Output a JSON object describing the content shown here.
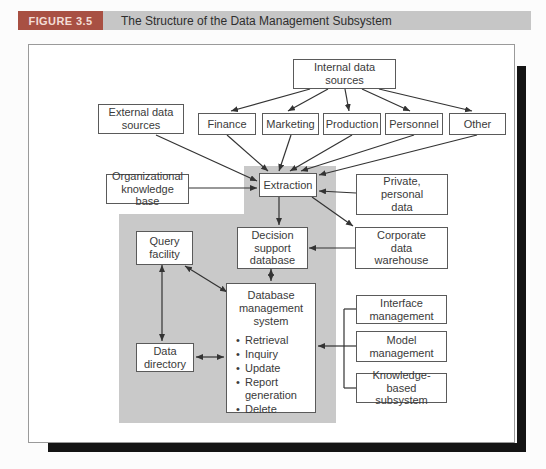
{
  "header": {
    "figure_label": "FIGURE 3.5",
    "title": "The Structure of the Data Management Subsystem"
  },
  "colors": {
    "figure_label_bg": "#a85043",
    "figure_label_text": "#f3ddd6",
    "header_bar_bg": "#c6c6c6",
    "panel_bg": "#ffffff",
    "panel_border": "#9a9a9a",
    "drop_shadow": "#141414",
    "shaded_region": "#c9c9c9",
    "box_border": "#5a5a5a",
    "arrow": "#333333",
    "text": "#3a3a3a"
  },
  "nodes": {
    "internal_data_sources": {
      "lines": [
        "Internal data",
        "sources"
      ]
    },
    "external_data_sources": {
      "lines": [
        "External data",
        "sources"
      ]
    },
    "finance": {
      "lines": [
        "Finance"
      ]
    },
    "marketing": {
      "lines": [
        "Marketing"
      ]
    },
    "production": {
      "lines": [
        "Production"
      ]
    },
    "personnel": {
      "lines": [
        "Personnel"
      ]
    },
    "other": {
      "lines": [
        "Other"
      ]
    },
    "organizational_knowledge_base": {
      "lines": [
        "Organizational",
        "knowledge base"
      ]
    },
    "extraction": {
      "lines": [
        "Extraction"
      ]
    },
    "private_personal_data": {
      "lines": [
        "Private,",
        "personal",
        "data"
      ]
    },
    "corporate_data_warehouse": {
      "lines": [
        "Corporate",
        "data",
        "warehouse"
      ]
    },
    "decision_support_database": {
      "lines": [
        "Decision",
        "support",
        "database"
      ]
    },
    "query_facility": {
      "lines": [
        "Query",
        "facility"
      ]
    },
    "database_management_system": {
      "lines": [
        "Database",
        "management",
        "system"
      ],
      "functions": [
        "Retrieval",
        "Inquiry",
        "Update",
        "Report generation",
        "Delete"
      ]
    },
    "data_directory": {
      "lines": [
        "Data",
        "directory"
      ]
    },
    "interface_management": {
      "lines": [
        "Interface",
        "management"
      ]
    },
    "model_management": {
      "lines": [
        "Model",
        "management"
      ]
    },
    "knowledge_based_subsystem": {
      "lines": [
        "Knowledge-based",
        "subsystem"
      ]
    }
  }
}
